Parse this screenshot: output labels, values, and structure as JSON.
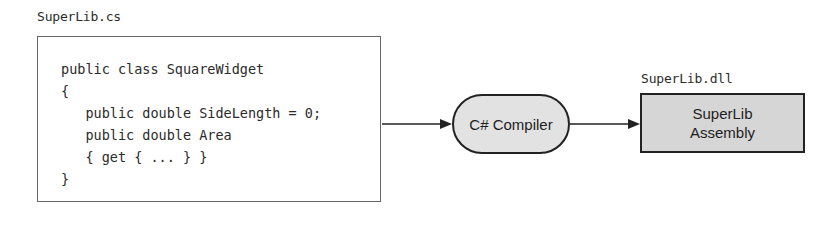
{
  "source_file": {
    "label": "SuperLib.cs",
    "code_lines": [
      "public class SquareWidget",
      "{",
      "   public double SideLength = 0;",
      "   public double Area",
      "   { get { ... } }",
      "}"
    ]
  },
  "compiler": {
    "label": "C# Compiler"
  },
  "output": {
    "file_label": "SuperLib.dll",
    "box_line1": "SuperLib",
    "box_line2": "Assembly"
  },
  "colors": {
    "compiler_fill": "#e2e2e2",
    "assembly_fill": "#d6d6d6",
    "stroke": "#222222"
  }
}
